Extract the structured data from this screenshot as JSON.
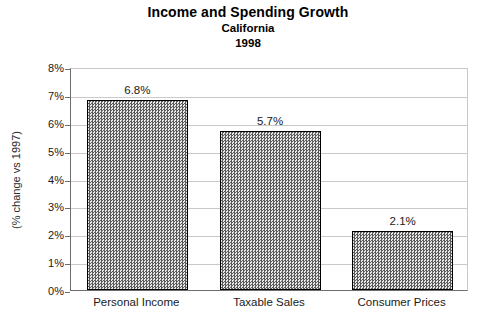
{
  "chart_data": {
    "type": "bar",
    "title": "Income and Spending Growth",
    "subtitle": "California",
    "subtitle2": "1998",
    "xlabel": "",
    "ylabel": "(% change vs 1997)",
    "categories": [
      "Personal Income",
      "Taxable Sales",
      "Consumer Prices"
    ],
    "values": [
      6.8,
      5.7,
      2.1
    ],
    "data_labels": [
      "6.8%",
      "5.7%",
      "2.1%"
    ],
    "ylim": [
      0,
      8
    ],
    "ytick_values": [
      0,
      1,
      2,
      3,
      4,
      5,
      6,
      7,
      8
    ],
    "ytick_labels": [
      "0%",
      "1%",
      "2%",
      "3%",
      "4%",
      "5%",
      "6%",
      "7%",
      "8%"
    ],
    "grid": true,
    "legend": false,
    "series": [
      {
        "name": "% change vs 1997",
        "values": [
          6.8,
          5.7,
          2.1
        ]
      }
    ],
    "colors": {
      "bar_fill": "#b9b9b9",
      "bar_edge": "#000000",
      "gridline": "#c9c9c9",
      "axis": "#6e6e6e",
      "text": "#1a1a1a",
      "background": "#ffffff"
    }
  }
}
